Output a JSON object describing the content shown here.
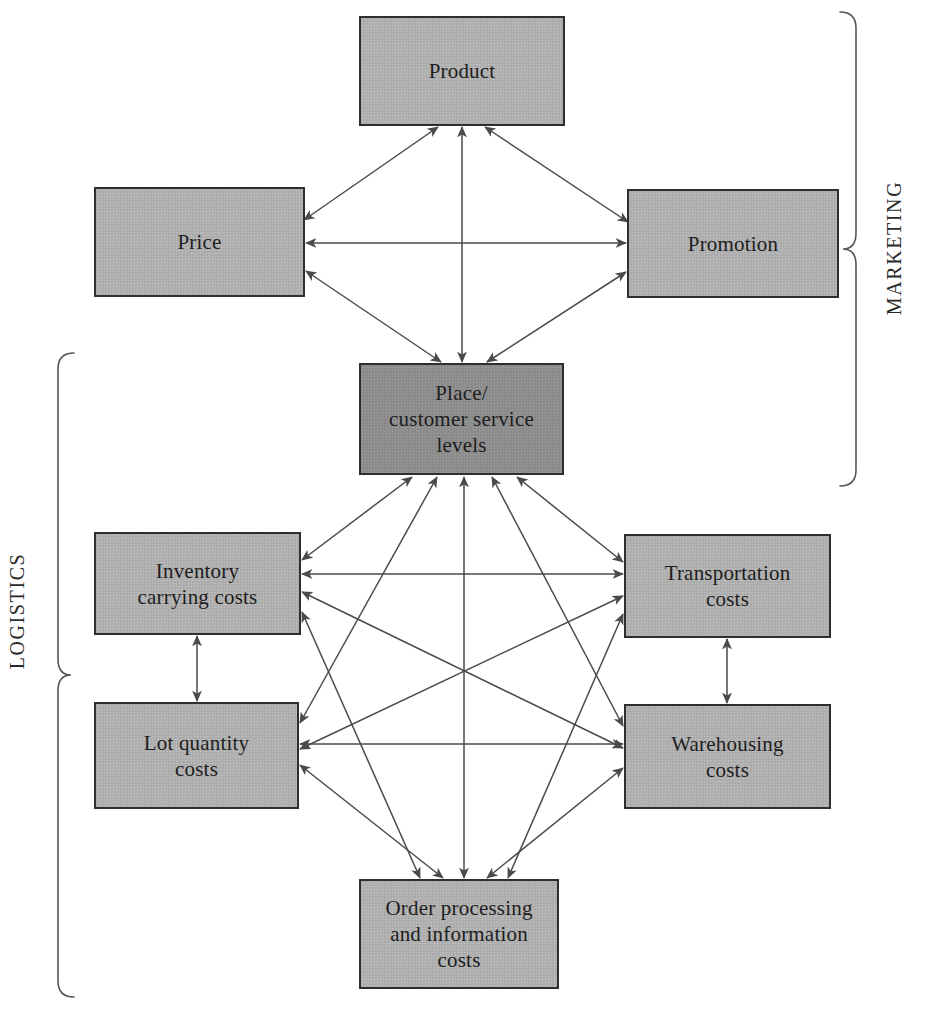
{
  "figure": {
    "background_color": "#ffffff",
    "edge_color": "#4a4a4a",
    "bracket_color": "#555555"
  },
  "nodes": [
    {
      "id": "product",
      "label": "Product",
      "lines": [
        "Product"
      ],
      "x": 360,
      "y": 17,
      "w": 204,
      "h": 108,
      "fill": "#b0b0b0",
      "group": "marketing"
    },
    {
      "id": "price",
      "label": "Price",
      "lines": [
        "Price"
      ],
      "x": 95,
      "y": 188,
      "w": 209,
      "h": 108,
      "fill": "#b0b0b0",
      "group": "marketing"
    },
    {
      "id": "promotion",
      "label": "Promotion",
      "lines": [
        "Promotion"
      ],
      "x": 628,
      "y": 190,
      "w": 210,
      "h": 107,
      "fill": "#b0b0b0",
      "group": "marketing"
    },
    {
      "id": "place",
      "label": "Place/customer service levels",
      "lines": [
        "Place/",
        "customer service",
        "levels"
      ],
      "x": 360,
      "y": 364,
      "w": 203,
      "h": 110,
      "fill": "#8e8e8e",
      "group": "marketing-logistics"
    },
    {
      "id": "inventory",
      "label": "Inventory carrying costs",
      "lines": [
        "Inventory",
        "carrying costs"
      ],
      "x": 95,
      "y": 533,
      "w": 205,
      "h": 101,
      "fill": "#b0b0b0",
      "group": "logistics"
    },
    {
      "id": "transportation",
      "label": "Transportation costs",
      "lines": [
        "Transportation",
        "costs"
      ],
      "x": 625,
      "y": 535,
      "w": 205,
      "h": 102,
      "fill": "#b0b0b0",
      "group": "logistics"
    },
    {
      "id": "lotquantity",
      "label": "Lot quantity costs",
      "lines": [
        "Lot quantity",
        "costs"
      ],
      "x": 95,
      "y": 703,
      "w": 203,
      "h": 105,
      "fill": "#b0b0b0",
      "group": "logistics"
    },
    {
      "id": "warehousing",
      "label": "Warehousing costs",
      "lines": [
        "Warehousing",
        "costs"
      ],
      "x": 625,
      "y": 705,
      "w": 205,
      "h": 103,
      "fill": "#b0b0b0",
      "group": "logistics"
    },
    {
      "id": "orderprocessing",
      "label": "Order processing and information costs",
      "lines": [
        "Order processing",
        "and information",
        "costs"
      ],
      "x": 360,
      "y": 880,
      "w": 198,
      "h": 108,
      "fill": "#b0b0b0",
      "group": "logistics"
    }
  ],
  "groups": [
    {
      "id": "marketing",
      "label": "MARKETING",
      "side": "right",
      "label_x": 901,
      "label_y": 248,
      "brace_x": 856,
      "brace_top": 12,
      "brace_bottom": 486
    },
    {
      "id": "logistics",
      "label": "LOGISTICS",
      "side": "left",
      "label_x": 24,
      "label_y": 611,
      "brace_x": 58,
      "brace_top": 353,
      "brace_bottom": 997
    }
  ],
  "edges": [
    {
      "from": "price",
      "to": "product",
      "x1": 304,
      "y1": 220,
      "x2": 438,
      "y2": 127,
      "arrows": "both"
    },
    {
      "from": "promotion",
      "to": "product",
      "x1": 628,
      "y1": 222,
      "x2": 485,
      "y2": 127,
      "arrows": "both"
    },
    {
      "from": "place",
      "to": "product",
      "x1": 462,
      "y1": 362,
      "x2": 462,
      "y2": 127,
      "arrows": "both"
    },
    {
      "from": "price",
      "to": "promotion",
      "x1": 306,
      "y1": 243,
      "x2": 626,
      "y2": 243,
      "arrows": "both"
    },
    {
      "from": "price",
      "to": "place",
      "x1": 306,
      "y1": 271,
      "x2": 441,
      "y2": 362,
      "arrows": "both"
    },
    {
      "from": "promotion",
      "to": "place",
      "x1": 626,
      "y1": 272,
      "x2": 487,
      "y2": 362,
      "arrows": "both"
    },
    {
      "from": "inventory",
      "to": "place",
      "x1": 302,
      "y1": 560,
      "x2": 412,
      "y2": 477,
      "arrows": "both"
    },
    {
      "from": "transportation",
      "to": "place",
      "x1": 623,
      "y1": 562,
      "x2": 517,
      "y2": 477,
      "arrows": "both"
    },
    {
      "from": "lotquantity",
      "to": "place",
      "x1": 300,
      "y1": 723,
      "x2": 437,
      "y2": 477,
      "arrows": "both"
    },
    {
      "from": "warehousing",
      "to": "place",
      "x1": 623,
      "y1": 726,
      "x2": 492,
      "y2": 477,
      "arrows": "both"
    },
    {
      "from": "orderprocessing",
      "to": "place",
      "x1": 464,
      "y1": 878,
      "x2": 464,
      "y2": 477,
      "arrows": "both"
    },
    {
      "from": "inventory",
      "to": "transportation",
      "x1": 302,
      "y1": 574,
      "x2": 623,
      "y2": 574,
      "arrows": "both"
    },
    {
      "from": "inventory",
      "to": "warehousing",
      "x1": 302,
      "y1": 592,
      "x2": 623,
      "y2": 748,
      "arrows": "both"
    },
    {
      "from": "inventory",
      "to": "orderprocessing",
      "x1": 302,
      "y1": 612,
      "x2": 420,
      "y2": 878,
      "arrows": "both"
    },
    {
      "from": "lotquantity",
      "to": "transportation",
      "x1": 300,
      "y1": 749,
      "x2": 623,
      "y2": 596,
      "arrows": "both"
    },
    {
      "from": "lotquantity",
      "to": "warehousing",
      "x1": 300,
      "y1": 744,
      "x2": 623,
      "y2": 744,
      "arrows": "both"
    },
    {
      "from": "lotquantity",
      "to": "orderprocessing",
      "x1": 300,
      "y1": 765,
      "x2": 443,
      "y2": 878,
      "arrows": "both"
    },
    {
      "from": "transportation",
      "to": "orderprocessing",
      "x1": 623,
      "y1": 614,
      "x2": 508,
      "y2": 878,
      "arrows": "both"
    },
    {
      "from": "warehousing",
      "to": "orderprocessing",
      "x1": 623,
      "y1": 768,
      "x2": 487,
      "y2": 878,
      "arrows": "both"
    },
    {
      "from": "inventory",
      "to": "lotquantity",
      "x1": 197,
      "y1": 636,
      "x2": 197,
      "y2": 701,
      "arrows": "both"
    },
    {
      "from": "transportation",
      "to": "warehousing",
      "x1": 727,
      "y1": 639,
      "x2": 727,
      "y2": 703,
      "arrows": "both"
    }
  ]
}
